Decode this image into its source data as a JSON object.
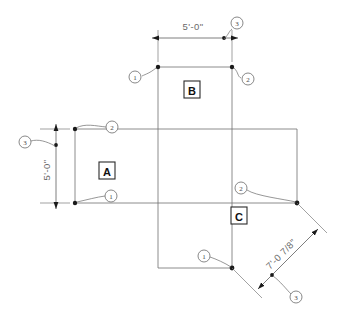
{
  "drawing": {
    "title": "Floor plan dimension layout",
    "background_color": "#ffffff",
    "line_color": "#6e6e6e",
    "text_color": "#6a6a6a",
    "node_color": "#1a1a1a"
  },
  "rooms": [
    {
      "id": "room-a",
      "label": "A",
      "cx": 107,
      "cy": 171
    },
    {
      "id": "room-b",
      "label": "B",
      "cx": 192,
      "cy": 90
    },
    {
      "id": "room-c",
      "label": "C",
      "cx": 239,
      "cy": 216
    }
  ],
  "dimensions": [
    {
      "id": "dim-top",
      "value": "5'-0\"",
      "orientation": "horizontal",
      "text_x": 193,
      "text_y": 26
    },
    {
      "id": "dim-left",
      "value": "5'-0\"",
      "orientation": "vertical",
      "text_x": 46,
      "text_y": 170
    },
    {
      "id": "dim-diagonal",
      "value": "7'-0 7/8\"",
      "orientation": "diagonal",
      "text_x": 281,
      "text_y": 256
    }
  ],
  "callouts": [
    {
      "id": "callout-b-left",
      "number": "1",
      "cx": 135,
      "cy": 77
    },
    {
      "id": "callout-b-right",
      "number": "2",
      "cx": 248,
      "cy": 79
    },
    {
      "id": "callout-top-three",
      "number": "3",
      "cx": 234,
      "cy": 22
    },
    {
      "id": "callout-a-top",
      "number": "2",
      "cx": 113,
      "cy": 128
    },
    {
      "id": "callout-a-bottom",
      "number": "1",
      "cx": 112,
      "cy": 197
    },
    {
      "id": "callout-left-three",
      "number": "3",
      "cx": 24,
      "cy": 143
    },
    {
      "id": "callout-c-right",
      "number": "2",
      "cx": 240,
      "cy": 188
    },
    {
      "id": "callout-c-bottom",
      "number": "1",
      "cx": 203,
      "cy": 258
    },
    {
      "id": "callout-diag-three",
      "number": "3",
      "cx": 297,
      "cy": 296
    }
  ]
}
